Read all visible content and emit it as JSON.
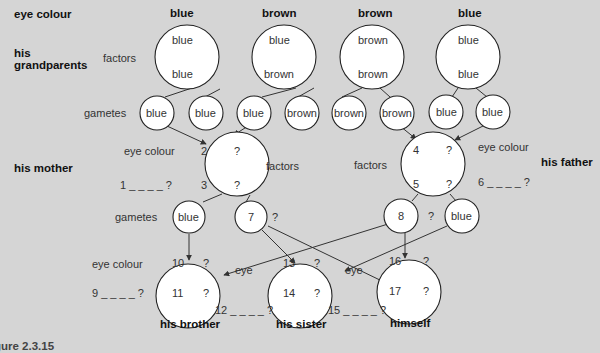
{
  "row_labels": {
    "eye_colour": "eye colour",
    "grandparents_line1": "his",
    "grandparents_line2": "grandparents",
    "mother": "his mother",
    "father": "his father"
  },
  "side_labels": {
    "factors_gp": "factors",
    "gametes_gp": "gametes",
    "mother_eye_colour": "eye colour",
    "mother_factors": "factors",
    "father_factors": "factors",
    "father_eye_colour": "eye colour",
    "mother_gametes": "gametes",
    "children_eye_colour": "eye colour",
    "eye_left": "eye",
    "eye_right": "eye"
  },
  "grandparents": [
    {
      "eye_colour": "blue",
      "factor_top": "blue",
      "factor_bottom": "blue",
      "gametes": [
        "blue",
        "blue"
      ]
    },
    {
      "eye_colour": "brown",
      "factor_top": "blue",
      "factor_bottom": "brown",
      "gametes": [
        "blue",
        "brown"
      ]
    },
    {
      "eye_colour": "brown",
      "factor_top": "brown",
      "factor_bottom": "brown",
      "gametes": [
        "brown",
        "brown"
      ]
    },
    {
      "eye_colour": "blue",
      "factor_top": "blue",
      "factor_bottom": "blue",
      "gametes": [
        "blue",
        "blue"
      ]
    }
  ],
  "mother": {
    "factor_top_num": "2",
    "factor_top_val": "?",
    "factor_bottom_num": "3",
    "factor_bottom_val": "?",
    "eye_colour_blank": "1 _ _ _ _ ?",
    "gametes": [
      {
        "label": "blue"
      },
      {
        "label": "7",
        "suffix": "?"
      }
    ]
  },
  "father": {
    "factor_top_num": "4",
    "factor_top_val": "?",
    "factor_bottom_num": "5",
    "factor_bottom_val": "?",
    "eye_colour_blank": "6 _ _ _ _ ?",
    "gametes": [
      {
        "label": "8",
        "suffix": "?"
      },
      {
        "label": "blue"
      }
    ]
  },
  "children": [
    {
      "name": "his brother",
      "top_num": "10",
      "top_val": "?",
      "bottom_num": "11",
      "bottom_val": "?",
      "eye_blank": "9 _ _ _ _ ?"
    },
    {
      "name": "his sister",
      "top_num": "13",
      "top_val": "?",
      "bottom_num": "14",
      "bottom_val": "?",
      "eye_blank": "12 _ _ _ _ ?"
    },
    {
      "name": "himself",
      "top_num": "16",
      "top_val": "?",
      "bottom_num": "17",
      "bottom_val": "?",
      "eye_blank": "15 _ _ _ _ ?"
    }
  ],
  "caption": "gure 2.3.15",
  "colors": {
    "background": "#d5d5d5",
    "circle_fill": "#ffffff",
    "stroke": "#222222"
  }
}
